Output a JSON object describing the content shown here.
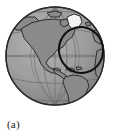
{
  "figure": {
    "caption": "(a)",
    "projection": "orthographic",
    "center_longitude": -75,
    "center_latitude": 15,
    "graticule_spacing_degrees": 30,
    "colors": {
      "background": "#ffffff",
      "ocean": "#9b9b9b",
      "land": "#8a8a8a",
      "land_highlight": "#f2f2f2",
      "coastline": "#1c1c1c",
      "graticule": "#6e6e6e",
      "limb": "#2a2a2a",
      "annotation": "#111111",
      "caption_text": "#1a1a1a"
    },
    "annotation": {
      "name": "region-of-interest-ellipse",
      "shape": "ellipse",
      "center_x_px": 81,
      "center_y_px": 50,
      "radius_x_px": 22,
      "radius_y_px": 23,
      "rotation_degrees": -12,
      "stroke_width_px": 2
    },
    "labels": {
      "north_america": "North America",
      "south_america": "South America",
      "greenland": "Greenland",
      "africa": "Africa",
      "europe": "Europe"
    }
  }
}
